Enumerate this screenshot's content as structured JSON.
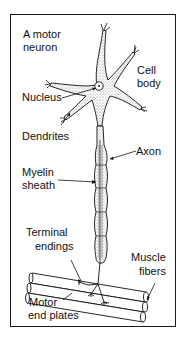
{
  "diagram": {
    "labels": {
      "title_line1": "A motor",
      "title_line2": "neuron",
      "cell_body_line1": "Cell",
      "cell_body_line2": "body",
      "nucleus": "Nucleus",
      "dendrites": "Dendrites",
      "axon": "Axon",
      "myelin_line1": "Myelin",
      "myelin_line2": "sheath",
      "terminal_line1": "Terminal",
      "terminal_line2": "endings",
      "muscle_line1": "Muscle",
      "muscle_line2": "fibers",
      "motor_line1": "Motor",
      "motor_line2": "end plates"
    },
    "colors": {
      "ink": "#111111",
      "stipple": "#bdbdbd",
      "background": "#ffffff"
    }
  }
}
